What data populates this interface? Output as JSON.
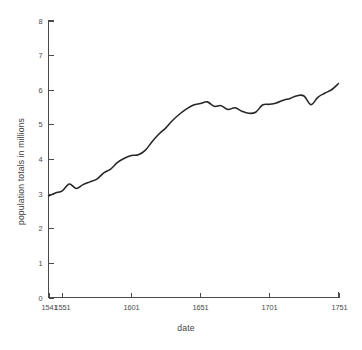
{
  "chart_data": {
    "type": "line",
    "title": "",
    "xlabel": "date",
    "ylabel": "population totals in millions",
    "xlim": [
      1541,
      1751
    ],
    "ylim": [
      0,
      8
    ],
    "grid": false,
    "legend": "none",
    "xtick_labels": [
      "1541",
      "1551",
      "1601",
      "1651",
      "1701",
      "1751"
    ],
    "xtick_values": [
      1541,
      1551,
      1601,
      1651,
      1701,
      1751
    ],
    "ytick_labels": [
      "0",
      "1",
      "2",
      "3",
      "4",
      "5",
      "6",
      "7",
      "8"
    ],
    "ytick_values": [
      0,
      1,
      2,
      3,
      4,
      5,
      6,
      7,
      8
    ],
    "series": [
      {
        "name": "population totals in millions",
        "color": "#262626",
        "x": [
          1541,
          1546,
          1551,
          1556,
          1561,
          1566,
          1571,
          1576,
          1581,
          1586,
          1591,
          1596,
          1601,
          1606,
          1611,
          1616,
          1621,
          1626,
          1631,
          1636,
          1641,
          1646,
          1651,
          1656,
          1661,
          1666,
          1671,
          1676,
          1681,
          1686,
          1691,
          1696,
          1701,
          1706,
          1711,
          1716,
          1721,
          1726,
          1731,
          1736,
          1741,
          1746,
          1751
        ],
        "values": [
          2.93,
          3.02,
          3.08,
          3.28,
          3.15,
          3.26,
          3.34,
          3.42,
          3.6,
          3.71,
          3.9,
          4.02,
          4.1,
          4.12,
          4.25,
          4.5,
          4.72,
          4.9,
          5.12,
          5.3,
          5.45,
          5.56,
          5.6,
          5.65,
          5.52,
          5.54,
          5.43,
          5.48,
          5.38,
          5.32,
          5.35,
          5.56,
          5.58,
          5.62,
          5.7,
          5.75,
          5.83,
          5.82,
          5.57,
          5.78,
          5.9,
          6.0,
          6.18
        ]
      }
    ]
  },
  "axes": {
    "x_axis_label": "date",
    "y_axis_label": "population totals in millions"
  }
}
